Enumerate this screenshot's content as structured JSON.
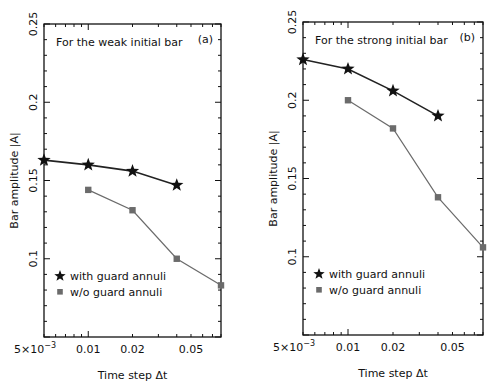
{
  "chart_data": [
    {
      "id": "a",
      "type": "line",
      "panel_label": "(a)",
      "annotation": "For the weak initial bar",
      "xlabel": "Time step Δt",
      "ylabel": "Bar amplitude |A|",
      "xscale": "log",
      "xlim": [
        0.005,
        0.08
      ],
      "ylim": [
        0.05,
        0.25
      ],
      "yticks": [
        0.1,
        0.15,
        0.2,
        0.25
      ],
      "ytick_labels": [
        "0.1",
        "0.15",
        "0.2",
        "0.25"
      ],
      "xticks": [
        0.005,
        0.01,
        0.02,
        0.05
      ],
      "xtick_labels": [
        "5×10⁻³",
        "0.01",
        "0.02",
        "0.05"
      ],
      "legend_position": "lower left",
      "grid": false,
      "series": [
        {
          "name": "with guard annuli",
          "marker": "star",
          "color": "#111111",
          "x": [
            0.005,
            0.01,
            0.02,
            0.04
          ],
          "y": [
            0.163,
            0.16,
            0.156,
            0.147
          ]
        },
        {
          "name": "w/o guard annuli",
          "marker": "square",
          "color": "#6b6b6b",
          "x": [
            0.01,
            0.02,
            0.04,
            0.08
          ],
          "y": [
            0.144,
            0.131,
            0.1,
            0.083
          ]
        }
      ]
    },
    {
      "id": "b",
      "type": "line",
      "panel_label": "(b)",
      "annotation": "For the strong initial bar",
      "xlabel": "Time step Δt",
      "ylabel": "Bar amplitude |A|",
      "xscale": "log",
      "xlim": [
        0.005,
        0.08
      ],
      "ylim": [
        0.05,
        0.25
      ],
      "yticks": [
        0.1,
        0.15,
        0.2,
        0.25
      ],
      "ytick_labels": [
        "0.1",
        "0.15",
        "0.2",
        "0.25"
      ],
      "xticks": [
        0.005,
        0.01,
        0.02,
        0.05
      ],
      "xtick_labels": [
        "5×10⁻³",
        "0.01",
        "0.02",
        "0.05"
      ],
      "legend_position": "lower left",
      "grid": false,
      "series": [
        {
          "name": "with guard annuli",
          "marker": "star",
          "color": "#111111",
          "x": [
            0.005,
            0.01,
            0.02,
            0.04
          ],
          "y": [
            0.226,
            0.22,
            0.206,
            0.19
          ]
        },
        {
          "name": "w/o guard annuli",
          "marker": "square",
          "color": "#6b6b6b",
          "x": [
            0.01,
            0.02,
            0.04,
            0.08
          ],
          "y": [
            0.2,
            0.182,
            0.138,
            0.106
          ]
        }
      ]
    }
  ]
}
